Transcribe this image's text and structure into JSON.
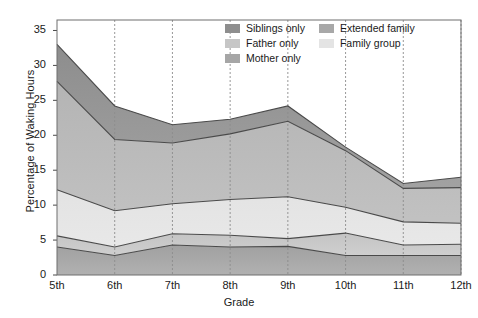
{
  "chart_data": {
    "type": "area",
    "stacked": true,
    "title": "",
    "xlabel": "Grade",
    "ylabel": "Percentage of Waking Hours",
    "categories": [
      "5th",
      "6th",
      "7th",
      "8th",
      "9th",
      "10th",
      "11th",
      "12th"
    ],
    "ylim": [
      0,
      36.5
    ],
    "yticks": [
      0,
      5,
      10,
      15,
      20,
      25,
      30,
      35
    ],
    "ytick_labels": [
      "0",
      "5",
      "10",
      "15",
      "20",
      "25",
      "30",
      "35"
    ],
    "grid": "vertical-dashed",
    "legend_position": "top-right-inside",
    "series": [
      {
        "name": "Mother only",
        "color": "#9d9d9d",
        "values": [
          4.0,
          2.8,
          4.3,
          4.0,
          4.1,
          2.8,
          2.8,
          2.8
        ]
      },
      {
        "name": "Father only",
        "color": "#bdbdbd",
        "values": [
          1.6,
          1.2,
          1.6,
          1.7,
          1.1,
          3.2,
          1.5,
          1.6
        ]
      },
      {
        "name": "Family group",
        "color": "#e2e2e2",
        "values": [
          6.6,
          5.2,
          4.3,
          5.1,
          6.0,
          3.7,
          3.3,
          3.0
        ]
      },
      {
        "name": "Extended family",
        "color": "#b6b6b6",
        "values": [
          15.5,
          10.2,
          8.7,
          9.4,
          10.8,
          8.1,
          4.8,
          5.1
        ]
      },
      {
        "name": "Siblings only",
        "color": "#8e8e8e",
        "values": [
          5.3,
          4.8,
          2.6,
          2.1,
          2.2,
          0.5,
          0.7,
          1.5
        ]
      }
    ],
    "cumulative_boundaries": {
      "mother_only": [
        4.0,
        2.8,
        4.3,
        4.0,
        4.1,
        2.8,
        2.8,
        2.8
      ],
      "father_only": [
        5.6,
        4.0,
        5.9,
        5.7,
        5.2,
        6.0,
        4.3,
        4.4
      ],
      "family_group": [
        12.2,
        9.2,
        10.2,
        10.8,
        11.2,
        9.7,
        7.6,
        7.4
      ],
      "extended_family": [
        27.7,
        19.4,
        18.9,
        20.2,
        22.0,
        17.8,
        12.4,
        12.5
      ],
      "total": [
        33.0,
        24.2,
        21.5,
        22.3,
        24.2,
        18.3,
        13.1,
        14.0
      ]
    }
  },
  "legend": {
    "entries": [
      {
        "label": "Siblings only",
        "color": "#8e8e8e"
      },
      {
        "label": "Extended family",
        "color": "#a8a8a8"
      },
      {
        "label": "Father only",
        "color": "#c6c6c6"
      },
      {
        "label": "Family group",
        "color": "#e4e4e4"
      },
      {
        "label": "Mother only",
        "color": "#a6a6a6"
      }
    ]
  },
  "axes": {
    "y_title": "Percentage of Waking Hours",
    "x_title": "Grade"
  },
  "colors": {
    "frame": "#6e6e6e",
    "line": "#4a4a4a",
    "gridline": "#8c8c8c",
    "text": "#1a1a1a"
  }
}
